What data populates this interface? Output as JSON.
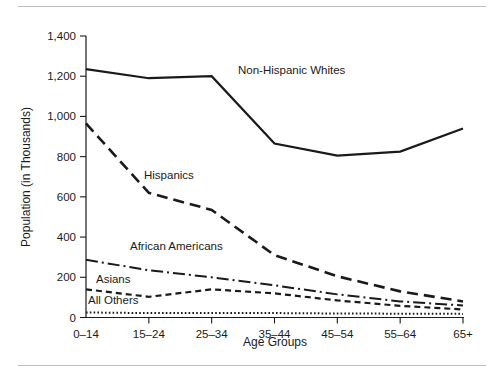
{
  "chart_data": {
    "type": "line",
    "title": "",
    "xlabel": "Age Groups",
    "ylabel": "Population (in Thousands)",
    "categories": [
      "0–14",
      "15–24",
      "25–34",
      "35–44",
      "45–54",
      "55–64",
      "65+"
    ],
    "ylim": [
      0,
      1400
    ],
    "yticks": [
      0,
      200,
      400,
      600,
      800,
      1000,
      1200,
      1400
    ],
    "ytick_labels": [
      "0",
      "200",
      "400",
      "600",
      "800",
      "1,000",
      "1,200",
      "1,400"
    ],
    "grid": false,
    "legend_position": "inline-labels",
    "series": [
      {
        "name": "Non-Hispanic Whites",
        "style": "solid",
        "color": "#1a1a1a",
        "values": [
          1235,
          1190,
          1200,
          865,
          805,
          825,
          940
        ],
        "label_x": "25–34",
        "label_offset": {
          "x": 152,
          "y": 74
        }
      },
      {
        "name": "Hispanics",
        "style": "dashed",
        "color": "#1a1a1a",
        "values": [
          965,
          620,
          535,
          310,
          205,
          130,
          80
        ],
        "label_offset": {
          "x": 58,
          "y": 179
        }
      },
      {
        "name": "African Americans",
        "style": "dash-dot",
        "color": "#1a1a1a",
        "values": [
          287,
          235,
          200,
          160,
          115,
          80,
          60
        ],
        "label_offset": {
          "x": 44,
          "y": 250
        }
      },
      {
        "name": "Asians",
        "style": "short-dashed",
        "color": "#1a1a1a",
        "values": [
          140,
          103,
          140,
          120,
          85,
          58,
          40
        ],
        "label_offset": {
          "x": 10,
          "y": 283
        }
      },
      {
        "name": "All Others",
        "style": "dotted",
        "color": "#1a1a1a",
        "values": [
          25,
          22,
          23,
          22,
          20,
          19,
          18
        ],
        "label_offset": {
          "x": 2,
          "y": 304
        }
      }
    ]
  },
  "axes": {
    "x_title": "Age Groups",
    "y_title": "Population (in Thousands)"
  },
  "colors": {
    "ink": "#1a1a1a",
    "rule": "#bdbdbd",
    "background": "#ffffff"
  }
}
